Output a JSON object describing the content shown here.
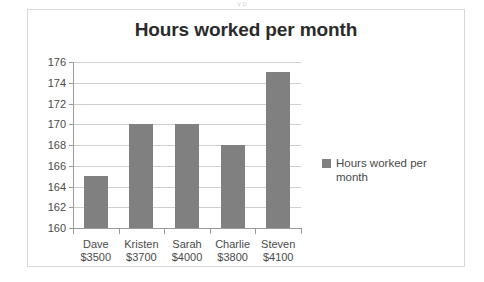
{
  "scan": {
    "top_artifact_text": "y p"
  },
  "chart_data": {
    "type": "bar",
    "title": "Hours worked per month",
    "categories": [
      "Dave",
      "Kristen",
      "Sarah",
      "Charlie",
      "Steven"
    ],
    "category_sublabels": [
      "$3500",
      "$3700",
      "$4000",
      "$3800",
      "$4100"
    ],
    "values": [
      165,
      170,
      170,
      168,
      175
    ],
    "series": [
      {
        "name": "Hours worked per month",
        "values": [
          165,
          170,
          170,
          168,
          175
        ]
      }
    ],
    "xlabel": "",
    "ylabel": "",
    "ylim": [
      160,
      176
    ],
    "ytick_step": 2,
    "yticks": [
      160,
      162,
      164,
      166,
      168,
      170,
      172,
      174,
      176
    ],
    "ytick_labels": [
      "160",
      "162",
      "164",
      "166",
      "168",
      "170",
      "172",
      "174",
      "176"
    ],
    "grid": true,
    "grid_axis": "y",
    "legend": {
      "position": "right",
      "entries": [
        "Hours worked per month"
      ]
    },
    "colors": {
      "bar": "#808080",
      "gridline": "#d0d0d0",
      "axis": "#9a9a9a",
      "title": "#2b2b2b",
      "tick_label": "#4a4a4a",
      "plot_background": "#ffffff",
      "chart_border": "#d9d9d9"
    }
  }
}
